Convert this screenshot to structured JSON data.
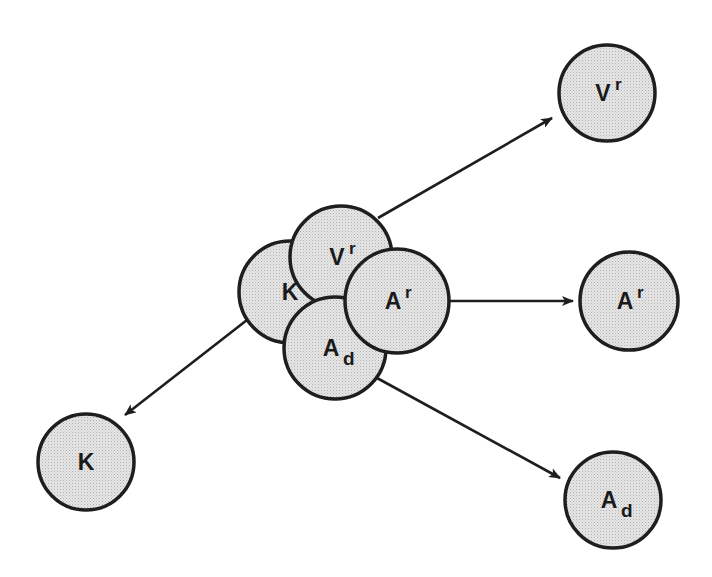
{
  "diagram": {
    "type": "dissociation-diagram",
    "colors": {
      "stroke": "#1e1e1e",
      "fill": "#e4e4e4",
      "dot": "#b8b8b8",
      "background": "#ffffff"
    },
    "complex": {
      "members": [
        {
          "id": "K",
          "base": "K",
          "mod": "",
          "mod_type": "none",
          "cx": 290,
          "cy": 292,
          "r": 51
        },
        {
          "id": "Vr",
          "base": "V",
          "mod": "r",
          "mod_type": "sup",
          "cx": 341,
          "cy": 257,
          "r": 51
        },
        {
          "id": "Ad",
          "base": "A",
          "mod": "d",
          "mod_type": "sub",
          "cx": 335,
          "cy": 348,
          "r": 51
        },
        {
          "id": "Ar",
          "base": "A",
          "mod": "r",
          "mod_type": "sup",
          "cx": 397,
          "cy": 301,
          "r": 52
        }
      ]
    },
    "products": [
      {
        "id": "Vr",
        "base": "V",
        "mod": "r",
        "mod_type": "sup",
        "cx": 607,
        "cy": 93,
        "r": 48
      },
      {
        "id": "Ar",
        "base": "A",
        "mod": "r",
        "mod_type": "sup",
        "cx": 629,
        "cy": 301,
        "r": 49
      },
      {
        "id": "K",
        "base": "K",
        "mod": "",
        "mod_type": "none",
        "cx": 86,
        "cy": 462,
        "r": 48
      },
      {
        "id": "Ad",
        "base": "A",
        "mod": "d",
        "mod_type": "sub",
        "cx": 613,
        "cy": 500,
        "r": 48
      }
    ],
    "arrows": [
      {
        "from": "Vr",
        "to": "Vr",
        "x1": 378,
        "y1": 218,
        "x2": 552,
        "y2": 118
      },
      {
        "from": "Ar",
        "to": "Ar",
        "x1": 450,
        "y1": 301,
        "x2": 573,
        "y2": 301
      },
      {
        "from": "K",
        "to": "K",
        "x1": 247,
        "y1": 320,
        "x2": 125,
        "y2": 415
      },
      {
        "from": "Ad",
        "to": "Ad",
        "x1": 377,
        "y1": 378,
        "x2": 560,
        "y2": 478
      }
    ]
  }
}
